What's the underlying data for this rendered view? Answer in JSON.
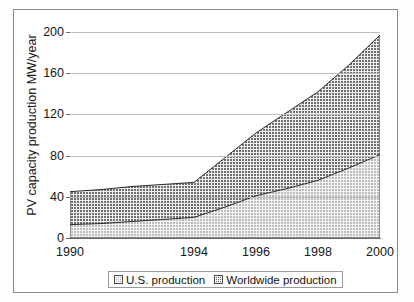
{
  "figure": {
    "background_color": "#ffffff",
    "border_color": "#8a8a8a"
  },
  "chart_data": {
    "type": "area",
    "title": "",
    "subtitle": "",
    "xlabel": "",
    "ylabel": "PV capacity production MW/year",
    "x": [
      1990,
      1991,
      1992,
      1993,
      1994,
      1995,
      1996,
      1997,
      1998,
      1999,
      2000
    ],
    "xtick_labels": [
      "1990",
      "1994",
      "1996",
      "1998",
      "2000"
    ],
    "xtick_values": [
      1990,
      1994,
      1996,
      1998,
      2000
    ],
    "ytick_labels": [
      "0",
      "40",
      "80",
      "120",
      "160",
      "200"
    ],
    "ytick_values": [
      0,
      40,
      80,
      120,
      160,
      200
    ],
    "xlim": [
      1990,
      2000
    ],
    "ylim": [
      0,
      200
    ],
    "grid": true,
    "grid_axis": "y",
    "stacked": false,
    "legend_position": "bottom",
    "series": [
      {
        "name": "Worldwide production",
        "fill": "cross-hatch-dark",
        "color": "#6d6d6d",
        "values": [
          45,
          47,
          50,
          52,
          54,
          78,
          102,
          122,
          142,
          168,
          197
        ]
      },
      {
        "name": "U.S. production",
        "fill": "cross-hatch-light",
        "color": "#b9b9b9",
        "values": [
          13,
          14,
          16,
          18,
          20,
          30,
          41,
          48,
          56,
          68,
          81
        ]
      }
    ]
  },
  "legend": {
    "entries": [
      {
        "label": "U.S. production",
        "swatch": "us-swatch"
      },
      {
        "label": "Worldwide production",
        "swatch": "worldwide-swatch"
      }
    ]
  }
}
